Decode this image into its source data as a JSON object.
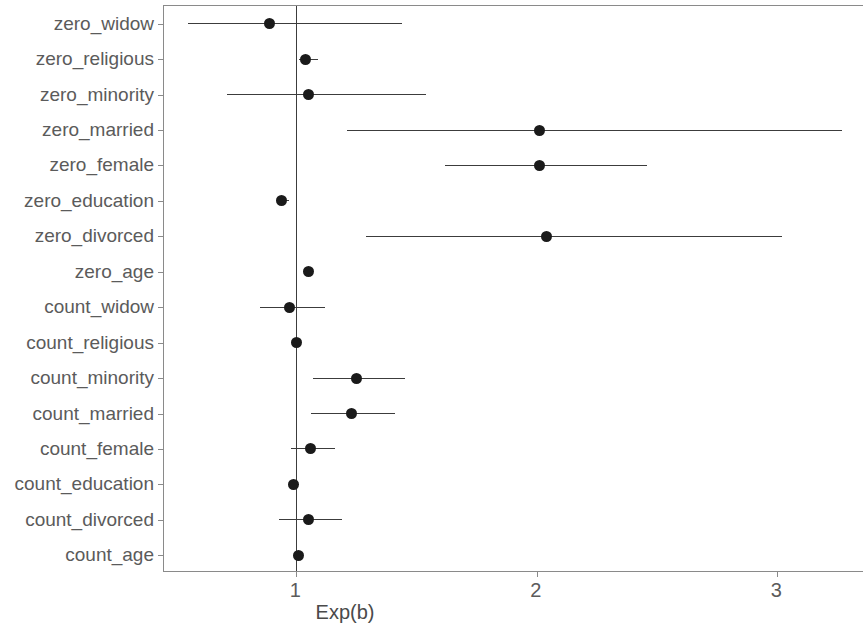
{
  "chart_data": {
    "type": "scatter",
    "subtype": "forest-plot",
    "title": "",
    "xlabel": "Exp(b)",
    "ylabel": "",
    "xticks": [
      1,
      2,
      3
    ],
    "xtick_labels": [
      "1",
      "2",
      "3"
    ],
    "xlim": [
      0.45,
      3.36
    ],
    "grid": false,
    "legend": null,
    "reference_line": 1,
    "categories": [
      "zero_widow",
      "zero_religious",
      "zero_minority",
      "zero_married",
      "zero_female",
      "zero_education",
      "zero_divorced",
      "zero_age",
      "count_widow",
      "count_religious",
      "count_minority",
      "count_married",
      "count_female",
      "count_education",
      "count_divorced",
      "count_age"
    ],
    "series": [
      {
        "name": "Exp(b)",
        "values": [
          0.89,
          1.04,
          1.05,
          2.01,
          2.01,
          0.94,
          2.04,
          1.05,
          0.97,
          1.0,
          1.25,
          1.23,
          1.06,
          0.99,
          1.05,
          1.01
        ]
      },
      {
        "name": "CI lower",
        "values": [
          0.55,
          1.01,
          0.71,
          1.21,
          1.62,
          0.92,
          1.29,
          1.04,
          0.85,
          0.99,
          1.07,
          1.06,
          0.98,
          0.98,
          0.93,
          1.0
        ]
      },
      {
        "name": "CI upper",
        "values": [
          1.44,
          1.09,
          1.54,
          3.27,
          2.46,
          0.97,
          3.02,
          1.06,
          1.12,
          1.02,
          1.45,
          1.41,
          1.16,
          1.01,
          1.19,
          1.02
        ]
      }
    ],
    "points": [
      {
        "label": "zero_widow",
        "estimate": 0.89,
        "ci_low": 0.55,
        "ci_high": 1.44
      },
      {
        "label": "zero_religious",
        "estimate": 1.04,
        "ci_low": 1.01,
        "ci_high": 1.09
      },
      {
        "label": "zero_minority",
        "estimate": 1.05,
        "ci_low": 0.71,
        "ci_high": 1.54
      },
      {
        "label": "zero_married",
        "estimate": 2.01,
        "ci_low": 1.21,
        "ci_high": 3.27
      },
      {
        "label": "zero_female",
        "estimate": 2.01,
        "ci_low": 1.62,
        "ci_high": 2.46
      },
      {
        "label": "zero_education",
        "estimate": 0.94,
        "ci_low": 0.92,
        "ci_high": 0.97
      },
      {
        "label": "zero_divorced",
        "estimate": 2.04,
        "ci_low": 1.29,
        "ci_high": 3.02
      },
      {
        "label": "zero_age",
        "estimate": 1.05,
        "ci_low": 1.04,
        "ci_high": 1.06
      },
      {
        "label": "count_widow",
        "estimate": 0.97,
        "ci_low": 0.85,
        "ci_high": 1.12
      },
      {
        "label": "count_religious",
        "estimate": 1.0,
        "ci_low": 0.99,
        "ci_high": 1.02
      },
      {
        "label": "count_minority",
        "estimate": 1.25,
        "ci_low": 1.07,
        "ci_high": 1.45
      },
      {
        "label": "count_married",
        "estimate": 1.23,
        "ci_low": 1.06,
        "ci_high": 1.41
      },
      {
        "label": "count_female",
        "estimate": 1.06,
        "ci_low": 0.98,
        "ci_high": 1.16
      },
      {
        "label": "count_education",
        "estimate": 0.99,
        "ci_low": 0.98,
        "ci_high": 1.01
      },
      {
        "label": "count_divorced",
        "estimate": 1.05,
        "ci_low": 0.93,
        "ci_high": 1.19
      },
      {
        "label": "count_age",
        "estimate": 1.01,
        "ci_low": 1.0,
        "ci_high": 1.02
      }
    ]
  },
  "style": {
    "point_color": "#1a1a1a",
    "line_color": "#3c3c3c",
    "axis_color": "#8a8a8a",
    "text_color": "#5b5b5b",
    "background": "#ffffff"
  }
}
